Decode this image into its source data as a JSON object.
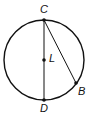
{
  "diagram": {
    "type": "circle-geometry",
    "colors": {
      "stroke": "#111111",
      "background": "#ffffff"
    },
    "circle": {
      "center_label": "L",
      "cx": 44,
      "cy": 60,
      "r": 40
    },
    "points": [
      {
        "id": "C",
        "label": "C",
        "x": 44,
        "y": 20,
        "label_x": 40,
        "label_y": 13
      },
      {
        "id": "L",
        "label": "L",
        "x": 44,
        "y": 60,
        "label_x": 49,
        "label_y": 62
      },
      {
        "id": "B",
        "label": "B",
        "x": 76,
        "y": 83,
        "label_x": 78,
        "label_y": 95
      },
      {
        "id": "D",
        "label": "D",
        "x": 44,
        "y": 100,
        "label_x": 40,
        "label_y": 112
      }
    ],
    "segments": [
      {
        "from": "C",
        "to": "D",
        "name": "diameter-CD"
      },
      {
        "from": "C",
        "to": "B",
        "name": "chord-CB"
      }
    ]
  }
}
